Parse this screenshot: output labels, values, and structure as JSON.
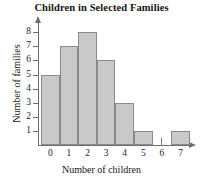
{
  "chart_data": {
    "type": "bar",
    "title": "Children in Selected Families",
    "xlabel": "Number of children",
    "ylabel": "Number of families",
    "categories": [
      "0",
      "1",
      "2",
      "3",
      "4",
      "5",
      "6",
      "7"
    ],
    "values": [
      5,
      7,
      8,
      6,
      3,
      1,
      0,
      1
    ],
    "ylim": [
      0,
      8
    ],
    "yticks": [
      "8",
      "7",
      "6",
      "5",
      "4",
      "3",
      "2",
      "1"
    ],
    "ytick_values": [
      8,
      7,
      6,
      5,
      4,
      3,
      2,
      1
    ],
    "xlim": [
      -0.5,
      7.5
    ],
    "grid": false,
    "legend": null,
    "bar_fill_color": "#c9c9c9",
    "bar_edge_color": "#8a8a8a",
    "axis_color": "#6e6e6e"
  }
}
